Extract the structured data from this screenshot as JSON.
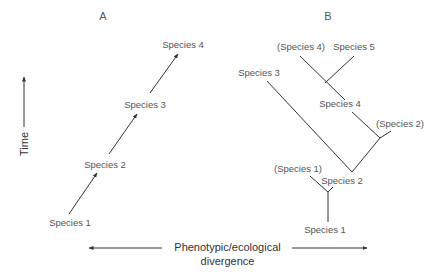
{
  "panels": {
    "a": {
      "title": "A",
      "species": [
        "Species 1",
        "Species 2",
        "Species 3",
        "Species 4"
      ]
    },
    "b": {
      "title": "B",
      "labels": {
        "species1": "Species 1",
        "species1_ancestral": "(Species 1)",
        "species2": "Species 2",
        "species2_ancestral": "(Species 2)",
        "species3": "Species 3",
        "species4": "Species 4",
        "species4_ancestral": "(Species 4)",
        "species5": "Species 5"
      }
    }
  },
  "axes": {
    "y_label": "Time",
    "x_label_line1": "Phenotypic/ecological",
    "x_label_line2": "divergence"
  },
  "colors": {
    "line": "#333333",
    "text": "#555555"
  }
}
